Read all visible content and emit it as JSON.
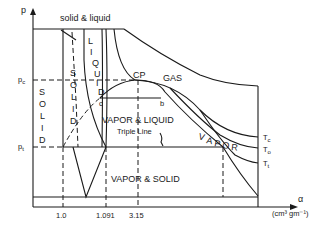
{
  "diagram": {
    "type": "P-alpha phase diagram",
    "axes": {
      "y_label": "p",
      "x_label": "α",
      "x_units": "(cm³ gm⁻¹)",
      "y_ticks": [
        "p_c",
        "p_t"
      ],
      "x_ticks": [
        "1.0",
        "1.091",
        "3.15"
      ]
    },
    "regions": {
      "solid_left": "SOLID",
      "solid_right": "SOLID",
      "liquid": "LIQUID",
      "gas": "GAS",
      "vapor": "VAPOR",
      "vapor_liquid": "VAPOR & LIQUID",
      "vapor_solid": "VAPOR & SOLID",
      "solid_liquid": "solid & liquid"
    },
    "points": {
      "critical_point": "CP",
      "c": "c",
      "b": "b"
    },
    "annotations": {
      "triple_line": "Triple Line"
    },
    "isotherms": [
      "T_c",
      "T_o",
      "T_t"
    ]
  }
}
